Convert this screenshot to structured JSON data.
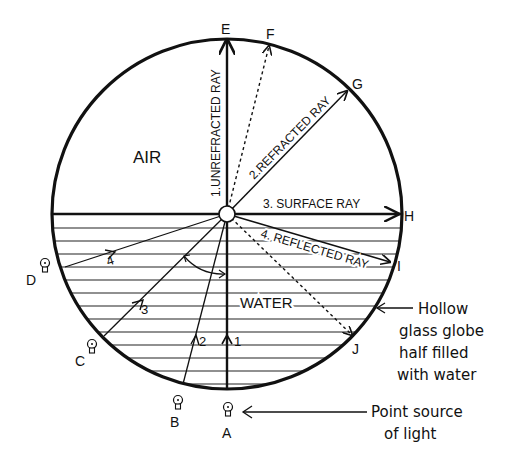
{
  "diagram": {
    "regions": {
      "air": "AIR",
      "water": "WATER"
    },
    "points": {
      "A": "A",
      "B": "B",
      "C": "C",
      "D": "D",
      "E": "E",
      "F": "F",
      "G": "G",
      "H": "H",
      "I": "I",
      "J": "J"
    },
    "rays": [
      {
        "id": 1,
        "label": "1.UNREFRACTED RAY",
        "from": "A",
        "to": "E",
        "marker": "1"
      },
      {
        "id": 2,
        "label": "2.REFRACTED RAY",
        "from": "B",
        "to": "G",
        "marker": "2"
      },
      {
        "id": 3,
        "label": "3. SURFACE RAY",
        "from": "C",
        "to": "H",
        "marker": "3"
      },
      {
        "id": 4,
        "label": "4. REFLECTED RAY",
        "from": "D",
        "to": "I",
        "marker": "4"
      }
    ],
    "dashed_rays": [
      {
        "to": "F"
      },
      {
        "to": "J"
      }
    ],
    "annotations": {
      "globe_line1": "Hollow",
      "globe_line2": "glass globe",
      "globe_line3": "half filled",
      "globe_line4": "with water",
      "source_line1": "Point source",
      "source_line2": "of light"
    },
    "colors": {
      "ink": "#111111",
      "background": "#ffffff"
    }
  }
}
